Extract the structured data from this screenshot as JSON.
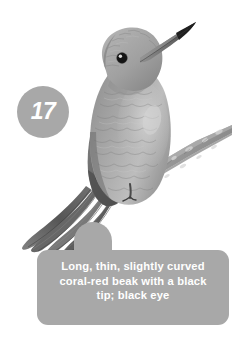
{
  "plate": {
    "background_color": "#ffffff",
    "width": 245,
    "height": 348
  },
  "badge": {
    "number": "17",
    "shape": "circle",
    "fill_color": "#a8a8a8",
    "text_color": "#ffffff"
  },
  "callout": {
    "text": "Long, thin, slightly curved\ncoral-red beak with a black\ntip; black eye",
    "lines": [
      "Long, thin, slightly curved",
      "coral-red beak with a black",
      "tip; black eye"
    ],
    "fill_color": "#a8a8a8",
    "text_color": "#ffffff"
  },
  "illustration": {
    "subject": "hummingbird-perched-on-branch",
    "rendering": "grayscale-pencil-illustration",
    "features": {
      "beak": "long thin slightly curved, upward to the right",
      "eye": "black round eye",
      "tail": "long pointed tail angled down-left",
      "perch": "diagonal twig branch under the feet"
    },
    "palette": {
      "body_light": "#c9c9c9",
      "body_mid": "#9a9a9a",
      "body_dark": "#6b6b6b",
      "shadow": "#4a4a4a",
      "eye": "#141414",
      "beak": "#5a5a5a",
      "branch": "#8e8e8e"
    }
  }
}
